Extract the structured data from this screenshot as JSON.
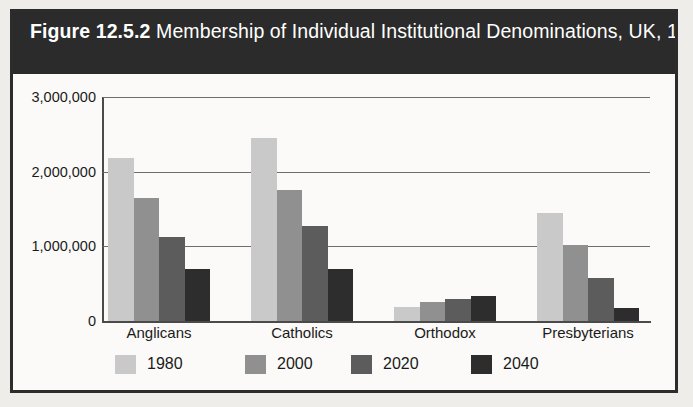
{
  "figure": {
    "title_label": "Figure 12.5.2",
    "title_rest": " Membership of Individual Institutional Denominations, UK, 1980–2040"
  },
  "chart_data": {
    "type": "bar",
    "title": "Figure 12.5.2 Membership of Individual Institutional Denominations, UK, 1980–2040",
    "xlabel": "",
    "ylabel": "",
    "ylim": [
      0,
      3000000
    ],
    "grid": true,
    "legend_position": "bottom",
    "categories": [
      "Anglicans",
      "Catholics",
      "Orthodox",
      "Presbyterians"
    ],
    "tick_labels": [
      "0",
      "1,000,000",
      "2,000,000",
      "3,000,000"
    ],
    "tick_values": [
      0,
      1000000,
      2000000,
      3000000
    ],
    "series": [
      {
        "name": "1980",
        "color": "#c9c9c9",
        "values": [
          2180000,
          2450000,
          190000,
          1440000
        ]
      },
      {
        "name": "2000",
        "color": "#909090",
        "values": [
          1650000,
          1760000,
          250000,
          1020000
        ]
      },
      {
        "name": "2020",
        "color": "#5c5c5c",
        "values": [
          1130000,
          1270000,
          300000,
          570000
        ]
      },
      {
        "name": "2040",
        "color": "#2d2d2d",
        "values": [
          690000,
          690000,
          340000,
          170000
        ]
      }
    ]
  }
}
